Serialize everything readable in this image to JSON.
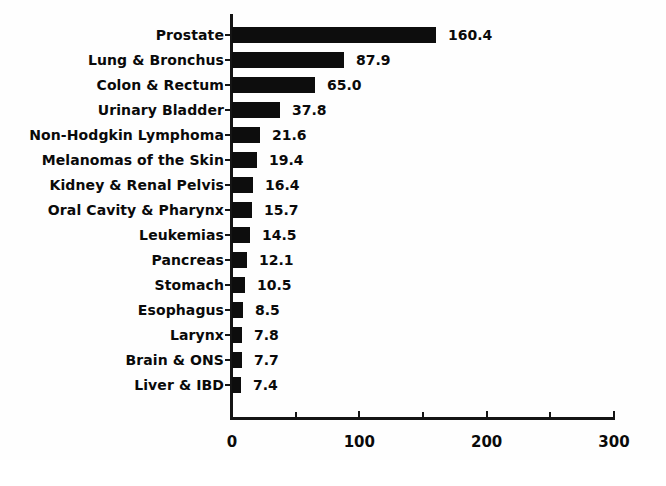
{
  "chart_data": {
    "type": "bar",
    "orientation": "horizontal",
    "title": "",
    "subtitle": "",
    "xlabel": "",
    "ylabel": "",
    "xlim": [
      0,
      300
    ],
    "grid": false,
    "legend": null,
    "bar_color": "#000000",
    "background_color": "#ffffff",
    "x_ticks": [
      {
        "value": 0,
        "label": "0",
        "major": true
      },
      {
        "value": 50,
        "label": "",
        "major": false
      },
      {
        "value": 100,
        "label": "100",
        "major": true
      },
      {
        "value": 150,
        "label": "",
        "major": false
      },
      {
        "value": 200,
        "label": "200",
        "major": true
      },
      {
        "value": 250,
        "label": "",
        "major": false
      },
      {
        "value": 300,
        "label": "300",
        "major": true
      }
    ],
    "categories": [
      "Prostate",
      "Lung & Bronchus",
      "Colon & Rectum",
      "Urinary Bladder",
      "Non-Hodgkin Lymphoma",
      "Melanomas of the Skin",
      "Kidney & Renal Pelvis",
      "Oral Cavity & Pharynx",
      "Leukemias",
      "Pancreas",
      "Stomach",
      "Esophagus",
      "Larynx",
      "Brain & ONS",
      "Liver & IBD"
    ],
    "values": [
      160.4,
      87.9,
      65.0,
      37.8,
      21.6,
      19.4,
      16.4,
      15.7,
      14.5,
      12.1,
      10.5,
      8.5,
      7.8,
      7.7,
      7.4
    ],
    "value_labels": [
      "160.4",
      "87.9",
      "65.0",
      "37.8",
      "21.6",
      "19.4",
      "16.4",
      "15.7",
      "14.5",
      "12.1",
      "10.5",
      "8.5",
      "7.8",
      "7.7",
      "7.4"
    ]
  }
}
